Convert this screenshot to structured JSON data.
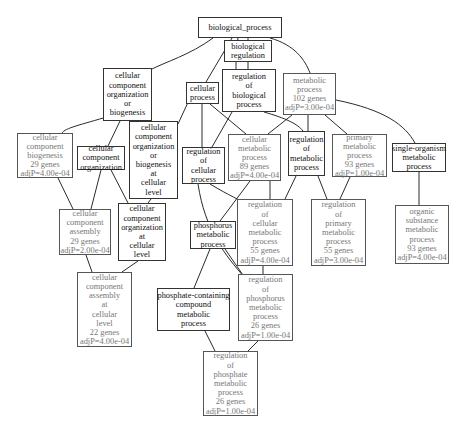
{
  "graph": {
    "title": "GO biological process enrichment graph",
    "nodes": [
      {
        "id": "n0",
        "lines": [
          "biological_process"
        ],
        "significant": false,
        "box": [
          198,
          17,
          84,
          21
        ]
      },
      {
        "id": "n1",
        "lines": [
          "biological",
          "regulation"
        ],
        "significant": false,
        "box": [
          224,
          40,
          48,
          22
        ]
      },
      {
        "id": "n2",
        "lines": [
          "regulation",
          "of",
          "biological",
          "process"
        ],
        "significant": false,
        "box": [
          222,
          69,
          54,
          43
        ]
      },
      {
        "id": "n3",
        "lines": [
          "metabolic",
          "process",
          "102 genes",
          "adjP=3.00e-04"
        ],
        "significant": true,
        "box": [
          283,
          73,
          53,
          42
        ]
      },
      {
        "id": "n4",
        "lines": [
          "cellular",
          "process"
        ],
        "significant": false,
        "box": [
          186,
          82,
          33,
          22
        ]
      },
      {
        "id": "n5",
        "lines": [
          "cellular",
          "component",
          "organization",
          "or",
          "biogenesis"
        ],
        "significant": false,
        "box": [
          103,
          68,
          49,
          53
        ]
      },
      {
        "id": "n6",
        "lines": [
          "cellular",
          "component",
          "biogenesis",
          "29 genes",
          "adjP=4.00e-04"
        ],
        "significant": true,
        "box": [
          17,
          133,
          56,
          45
        ]
      },
      {
        "id": "n7",
        "lines": [
          "cellular",
          "component",
          "organization"
        ],
        "significant": false,
        "box": [
          77,
          146,
          48,
          24
        ]
      },
      {
        "id": "n8",
        "lines": [
          "cellular",
          "component",
          "organization",
          "or",
          "biogenesis",
          "at",
          "cellular",
          "level"
        ],
        "significant": false,
        "box": [
          129,
          121,
          49,
          78
        ]
      },
      {
        "id": "n9",
        "lines": [
          "regulation",
          "of",
          "cellular",
          "process"
        ],
        "significant": false,
        "box": [
          182,
          147,
          43,
          37
        ]
      },
      {
        "id": "n10",
        "lines": [
          "cellular",
          "metabolic",
          "process",
          "89 genes",
          "adjP=4.00e-04"
        ],
        "significant": true,
        "box": [
          228,
          134,
          53,
          47
        ]
      },
      {
        "id": "n11",
        "lines": [
          "regulation",
          "of",
          "metabolic",
          "process"
        ],
        "significant": false,
        "box": [
          288,
          131,
          37,
          45
        ]
      },
      {
        "id": "n12",
        "lines": [
          "primary",
          "metabolic",
          "process",
          "93 genes",
          "adjP=1.00e-04"
        ],
        "significant": true,
        "box": [
          332,
          134,
          55,
          43
        ]
      },
      {
        "id": "n13",
        "lines": [
          "single-organism",
          "metabolic",
          "process"
        ],
        "significant": false,
        "box": [
          392,
          143,
          54,
          29
        ]
      },
      {
        "id": "n14",
        "lines": [
          "cellular",
          "component",
          "assembly",
          "29 genes",
          "adjP=2.00e-04"
        ],
        "significant": true,
        "box": [
          59,
          209,
          52,
          46
        ]
      },
      {
        "id": "n15",
        "lines": [
          "cellular",
          "component",
          "organization",
          "at",
          "cellular",
          "level"
        ],
        "significant": false,
        "box": [
          118,
          203,
          48,
          58
        ]
      },
      {
        "id": "n16",
        "lines": [
          "regulation",
          "of",
          "cellular",
          "metabolic",
          "process",
          "55 genes",
          "adjP=4.00e-04"
        ],
        "significant": true,
        "box": [
          237,
          199,
          56,
          67
        ]
      },
      {
        "id": "n17",
        "lines": [
          "regulation",
          "of",
          "primary",
          "metabolic",
          "process",
          "55 genes",
          "adjP=3.00e-04"
        ],
        "significant": true,
        "box": [
          311,
          199,
          55,
          67
        ]
      },
      {
        "id": "n18",
        "lines": [
          "organic",
          "substance",
          "metabolic",
          "process",
          "93 genes",
          "adjP=4.00e-04"
        ],
        "significant": true,
        "box": [
          395,
          205,
          54,
          59
        ]
      },
      {
        "id": "n19",
        "lines": [
          "phosphorus",
          "metabolic",
          "process"
        ],
        "significant": false,
        "box": [
          190,
          221,
          46,
          28
        ]
      },
      {
        "id": "n20",
        "lines": [
          "cellular",
          "component",
          "assembly",
          "at",
          "cellular",
          "level",
          "22 genes",
          "adjP=4.00e-04"
        ],
        "significant": true,
        "box": [
          77,
          272,
          55,
          75
        ]
      },
      {
        "id": "n21",
        "lines": [
          "phosphate-containing",
          "compound",
          "metabolic",
          "process"
        ],
        "significant": false,
        "box": [
          157,
          288,
          73,
          43
        ]
      },
      {
        "id": "n22",
        "lines": [
          "regulation",
          "of",
          "phosphorus",
          "metabolic",
          "process",
          "26 genes",
          "adjP=1.00e-04"
        ],
        "significant": true,
        "box": [
          238,
          274,
          55,
          67
        ]
      },
      {
        "id": "n23",
        "lines": [
          "regulation",
          "of",
          "phosphate",
          "metabolic",
          "process",
          "26 genes",
          "adjP=1.00e-04"
        ],
        "significant": true,
        "box": [
          203,
          351,
          55,
          65
        ]
      }
    ],
    "edges": [
      {
        "from": "n0",
        "to": "n5",
        "d": "M213,38 C190,55 165,62 150,70"
      },
      {
        "from": "n0",
        "to": "n4",
        "d": "M232,38 L206,82"
      },
      {
        "from": "n0",
        "to": "n1",
        "d": "M248,38 L248,40"
      },
      {
        "from": "n0",
        "to": "n2",
        "d": "M238,38 C236,50 236,62 236,69"
      },
      {
        "from": "n0",
        "to": "n3",
        "d": "M270,38 C295,45 305,60 310,73"
      },
      {
        "from": "n1",
        "to": "n2",
        "d": "M248,62 L248,69"
      },
      {
        "from": "n5",
        "to": "n6",
        "d": "M110,116 C80,125 65,128 62,133"
      },
      {
        "from": "n5",
        "to": "n7",
        "d": "M120,121 L108,146"
      },
      {
        "from": "n5",
        "to": "n8",
        "d": "M137,121 L140,121"
      },
      {
        "from": "n4",
        "to": "n8",
        "d": "M190,98 L178,124"
      },
      {
        "from": "n4",
        "to": "n9",
        "d": "M202,104 L202,147"
      },
      {
        "from": "n4",
        "to": "n10",
        "d": "M210,104 L246,134"
      },
      {
        "from": "n2",
        "to": "n9",
        "d": "M232,112 L212,147"
      },
      {
        "from": "n2",
        "to": "n11",
        "d": "M264,112 C285,118 298,124 303,131"
      },
      {
        "from": "n3",
        "to": "n10",
        "d": "M292,115 L268,134"
      },
      {
        "from": "n3",
        "to": "n11",
        "d": "M308,115 L308,131"
      },
      {
        "from": "n3",
        "to": "n12",
        "d": "M325,115 L347,134"
      },
      {
        "from": "n3",
        "to": "n13",
        "d": "M336,100 C385,110 405,125 415,143"
      },
      {
        "from": "n6",
        "to": "n14",
        "d": "M58,178 L73,209"
      },
      {
        "from": "n7",
        "to": "n14",
        "d": "M101,170 L91,209"
      },
      {
        "from": "n7",
        "to": "n15",
        "d": "M111,170 L128,203"
      },
      {
        "from": "n8",
        "to": "n15",
        "d": "M151,199 L148,203"
      },
      {
        "from": "n9",
        "to": "n16",
        "d": "M210,184 C230,196 240,200 248,205"
      },
      {
        "from": "n10",
        "to": "n16",
        "d": "M270,181 L270,199"
      },
      {
        "from": "n10",
        "to": "n19",
        "d": "M250,181 L220,221"
      },
      {
        "from": "n11",
        "to": "n16",
        "d": "M296,176 L285,199"
      },
      {
        "from": "n11",
        "to": "n17",
        "d": "M318,176 L327,199"
      },
      {
        "from": "n12",
        "to": "n17",
        "d": "M350,177 L340,199"
      },
      {
        "from": "n13",
        "to": "n18",
        "d": "M419,172 L419,205"
      },
      {
        "from": "n14",
        "to": "n20",
        "d": "M86,255 L92,272"
      },
      {
        "from": "n15",
        "to": "n20",
        "d": "M138,261 L122,272"
      },
      {
        "from": "n16",
        "to": "n22",
        "d": "M263,266 L263,274"
      },
      {
        "from": "n19",
        "to": "n21",
        "d": "M210,249 L194,288"
      },
      {
        "from": "n19",
        "to": "n22",
        "d": "M225,249 L245,278"
      },
      {
        "from": "n9",
        "to": "n22",
        "d": "M198,184 C205,230 225,255 245,278"
      },
      {
        "from": "n21",
        "to": "n23",
        "d": "M205,331 L215,351"
      },
      {
        "from": "n22",
        "to": "n23",
        "d": "M258,341 L248,351"
      }
    ]
  }
}
